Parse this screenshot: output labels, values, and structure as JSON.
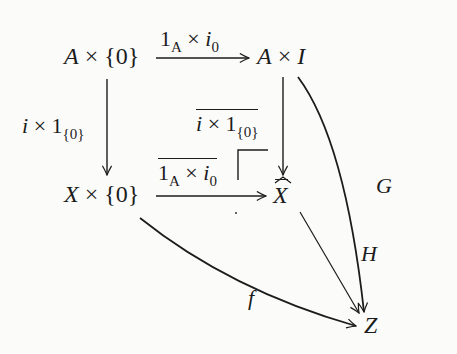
{
  "diagram": {
    "type": "commutative-diagram",
    "nodes": {
      "top_left": {
        "base": "A",
        "times": "×",
        "set": "{0}"
      },
      "top_right": {
        "base": "A",
        "times": "×",
        "space": "I"
      },
      "bottom_left": {
        "base": "X",
        "times": "×",
        "set": "{0}"
      },
      "bottom_right": {
        "base": "X",
        "hat": "^"
      },
      "target": {
        "base": "Z"
      }
    },
    "arrows": {
      "top": {
        "one": "1",
        "sub": "A",
        "times": "×",
        "map": "i",
        "map_sub": "0"
      },
      "left": {
        "map": "i",
        "times": "×",
        "one": "1",
        "sub": "{0}"
      },
      "inner_vertical": {
        "map": "i",
        "times": "×",
        "one": "1",
        "sub": "{0}",
        "overline": true
      },
      "inner_horizontal": {
        "one": "1",
        "sub": "A",
        "times": "×",
        "map": "i",
        "map_sub": "0",
        "overline": true
      },
      "G": {
        "label": "G"
      },
      "H": {
        "label": "H"
      },
      "f": {
        "label": "f"
      }
    },
    "pullback_corner": true
  }
}
